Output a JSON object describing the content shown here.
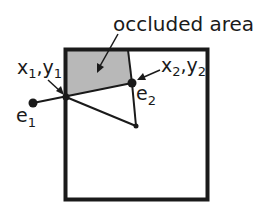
{
  "diagram": {
    "title_label": "occluded area",
    "point_labels": {
      "x1y1_main_x": "x",
      "x1y1_sub1": "1",
      "x1y1_comma": ",",
      "x1y1_main_y": "y",
      "x1y1_sub2": "1",
      "x2y2_main_x": "x",
      "x2y2_sub1": "2",
      "x2y2_comma": ",",
      "x2y2_main_y": "y",
      "x2y2_sub2": "2",
      "e1_main": "e",
      "e1_sub": "1",
      "e2_main": "e",
      "e2_sub": "2"
    },
    "colors": {
      "stroke": "#1a1a1a",
      "occluded_fill": "#b8b8b8",
      "background": "#ffffff"
    }
  }
}
